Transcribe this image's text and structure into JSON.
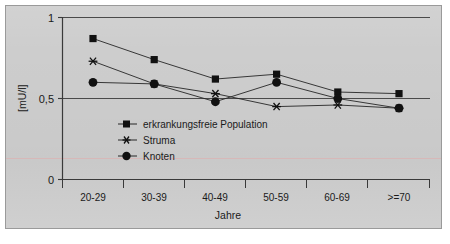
{
  "chart_data": {
    "type": "line",
    "title": "",
    "xlabel": "Jahre",
    "ylabel": "[mU/l]",
    "categories": [
      "20-29",
      "30-39",
      "40-49",
      "50-59",
      "60-69",
      ">=70"
    ],
    "ylim": [
      0,
      1
    ],
    "yticks": [
      "0",
      "0,5",
      "1"
    ],
    "ytick_values": [
      0,
      0.5,
      1
    ],
    "grid": "horizontal-gridlines-at-0.5-and-1",
    "legend_position": "inside-lower-left",
    "series": [
      {
        "name": "erkrankungsfreie Population",
        "marker": "square",
        "values": [
          0.87,
          0.74,
          0.62,
          0.65,
          0.54,
          0.53
        ]
      },
      {
        "name": "Struma",
        "marker": "asterisk",
        "values": [
          0.73,
          0.59,
          0.53,
          0.45,
          0.46,
          0.44
        ]
      },
      {
        "name": "Knoten",
        "marker": "circle",
        "values": [
          0.6,
          0.59,
          0.48,
          0.6,
          0.5,
          0.44
        ]
      }
    ],
    "colors": {
      "series_line": "#262626",
      "marker": "#111111",
      "axis": "#3a3a3a",
      "gridline": "#555555",
      "panel_background": "#cdcdcd"
    }
  },
  "legend": {
    "items": [
      {
        "label": "erkrankungsfreie Population",
        "marker": "square-marker-icon"
      },
      {
        "label": "Struma",
        "marker": "asterisk-marker-icon"
      },
      {
        "label": "Knoten",
        "marker": "circle-marker-icon"
      }
    ]
  },
  "axes": {
    "y_axis_title": "[mU/l]",
    "x_axis_title": "Jahre",
    "y_tick_top": "1",
    "y_tick_mid": "0,5",
    "y_tick_bottom": "0"
  }
}
